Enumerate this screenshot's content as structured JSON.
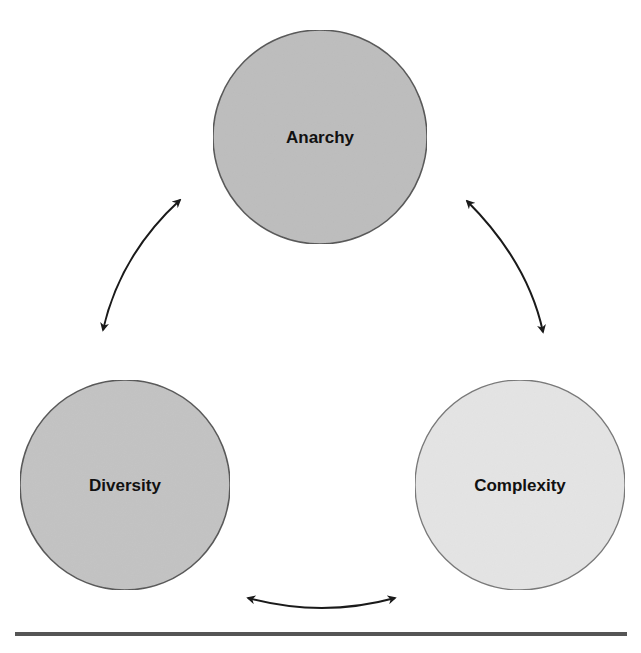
{
  "diagram": {
    "nodes": [
      {
        "id": "anarchy",
        "label": "Anarchy",
        "cx": 320,
        "cy": 137,
        "r": 107,
        "fill": "#bdbdbd"
      },
      {
        "id": "diversity",
        "label": "Diversity",
        "cx": 125,
        "cy": 485,
        "r": 105,
        "fill": "#c3c3c3"
      },
      {
        "id": "complexity",
        "label": "Complexity",
        "cx": 520,
        "cy": 485,
        "r": 105,
        "fill": "#e4e4e4"
      }
    ],
    "edges": [
      {
        "from": "anarchy",
        "to": "diversity",
        "direction": "bidirectional"
      },
      {
        "from": "anarchy",
        "to": "complexity",
        "direction": "bidirectional"
      },
      {
        "from": "diversity",
        "to": "complexity",
        "direction": "bidirectional"
      }
    ],
    "colors": {
      "stroke": "#555555",
      "arrow": "#1a1a1a",
      "rule": "#555555"
    }
  }
}
